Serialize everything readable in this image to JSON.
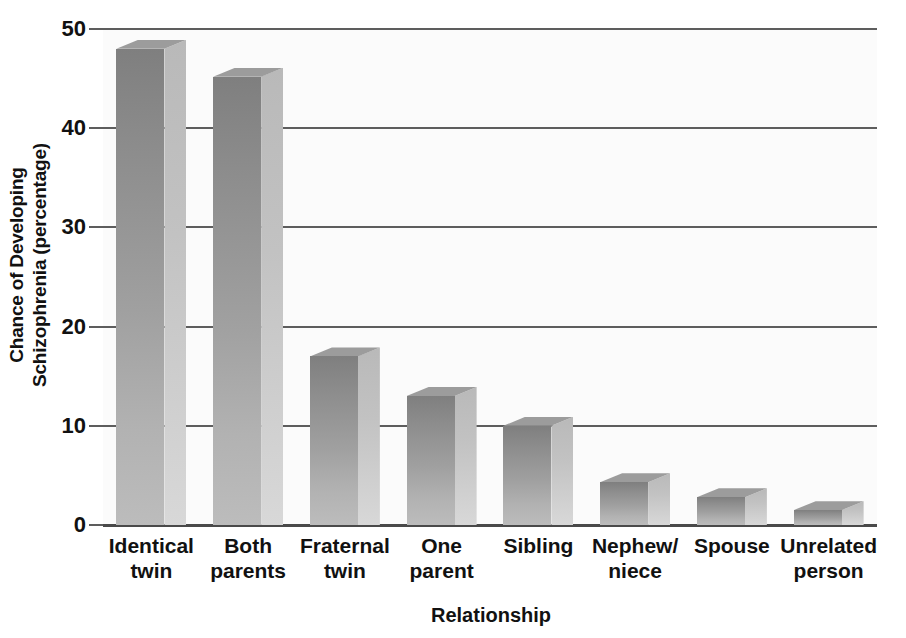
{
  "chart_data": {
    "type": "bar",
    "title": "",
    "xlabel": "Relationship",
    "ylabel": "Chance of Developing Schizophrenia (percentage)",
    "ylabel_lines": [
      "Chance of Developing",
      "Schizophrenia (percentage)"
    ],
    "categories": [
      "Identical twin",
      "Both parents",
      "Fraternal twin",
      "One parent",
      "Sibling",
      "Nephew/ niece",
      "Spouse",
      "Unrelated person"
    ],
    "category_lines": [
      [
        "Identical",
        "twin"
      ],
      [
        "Both",
        "parents"
      ],
      [
        "Fraternal",
        "twin"
      ],
      [
        "One",
        "parent"
      ],
      [
        "Sibling",
        ""
      ],
      [
        "Nephew/",
        "niece"
      ],
      [
        "Spouse",
        ""
      ],
      [
        "Unrelated",
        "person"
      ]
    ],
    "values": [
      48,
      45.2,
      17,
      13,
      10,
      4.3,
      2.8,
      1.5
    ],
    "ylim": [
      0,
      50
    ],
    "yticks": [
      0,
      10,
      20,
      30,
      40,
      50
    ],
    "ytick_labels": [
      "0",
      "10",
      "20",
      "30",
      "40",
      "50"
    ],
    "grid": true,
    "legend": false,
    "bar_style": "3d-extruded",
    "colors": {
      "bar_front_top": "#7f7f7f",
      "bar_front_bottom": "#bcbcbc",
      "bar_side": "#c6c6c6",
      "bar_top_face": "#9c9c9c",
      "axis": "#5d5d5d",
      "text": "#111111",
      "background": "#ffffff",
      "plot_background": "#fbfbfb"
    }
  }
}
